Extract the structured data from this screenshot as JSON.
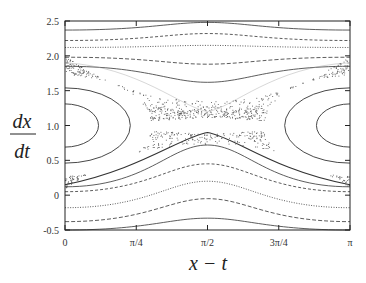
{
  "chart_data": {
    "type": "scatter",
    "title": "",
    "xlabel": "x − t",
    "ylabel_num": "dx",
    "ylabel_den": "dt",
    "xlim": [
      0,
      3.14159
    ],
    "ylim": [
      -0.5,
      2.5
    ],
    "x_ticks": [
      {
        "value": 0,
        "label": "0"
      },
      {
        "value": 0.7854,
        "label": "π/4"
      },
      {
        "value": 1.5708,
        "label": "π/2"
      },
      {
        "value": 2.3562,
        "label": "3π/4"
      },
      {
        "value": 3.14159,
        "label": "π"
      }
    ],
    "y_ticks": [
      {
        "value": -0.5,
        "label": "-0.5"
      },
      {
        "value": 0,
        "label": "0"
      },
      {
        "value": 0.5,
        "label": "0.5"
      },
      {
        "value": 1.0,
        "label": "1.0"
      },
      {
        "value": 1.5,
        "label": "1.5"
      },
      {
        "value": 2.0,
        "label": "2.0"
      },
      {
        "value": 2.5,
        "label": "2.5"
      }
    ],
    "grid": false,
    "legend": null,
    "islands": [
      {
        "center_x": 0,
        "center_y": 1.0,
        "rx": [
          0.37,
          0.72
        ],
        "ry": [
          0.31,
          0.54
        ]
      },
      {
        "center_x": 3.14159,
        "center_y": 1.0,
        "rx": [
          0.37,
          0.72
        ],
        "ry": [
          0.31,
          0.54
        ]
      }
    ],
    "upper_curves_y_at_edges_and_center": [
      [
        2.37,
        2.48
      ],
      [
        2.22,
        2.32
      ],
      [
        2.12,
        2.15
      ],
      [
        1.98,
        1.88
      ],
      [
        1.85,
        1.62
      ]
    ],
    "lower_curves_y_at_edges_and_center": [
      [
        0.12,
        0.72
      ],
      [
        0.05,
        0.45
      ],
      [
        -0.18,
        0.2
      ],
      [
        -0.38,
        -0.05
      ],
      [
        -0.5,
        -0.33
      ]
    ],
    "chaotic_layer": {
      "x_range": [
        0,
        3.14159
      ],
      "y_range": [
        0.1,
        2.0
      ],
      "hyperbolic_point": [
        1.5708,
        1.0
      ]
    }
  }
}
